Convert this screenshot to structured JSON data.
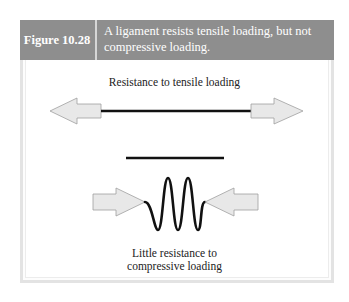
{
  "figure": {
    "number_label": "Figure 10.28",
    "caption": "A ligament resists tensile loading, but not compressive loading.",
    "colors": {
      "header_bg": "#8e8e8e",
      "header_text": "#ffffff",
      "frame_border": "#e3e3e3",
      "arrow_fill": "#e8e8e8",
      "arrow_stroke": "#a0a0a0",
      "ligament": "#111111"
    }
  },
  "diagram": {
    "tensile": {
      "label": "Resistance to tensile loading",
      "arrows": [
        "arrow-left-outward",
        "arrow-right-outward"
      ],
      "ligament_state": "taut straight line"
    },
    "resting_ligament": {
      "state": "straight line (reference length)"
    },
    "compressive": {
      "label_line1": "Little resistance to",
      "label_line2": "compressive loading",
      "arrows": [
        "arrow-right-inward",
        "arrow-left-inward"
      ],
      "ligament_state": "buckled wavy line"
    }
  }
}
